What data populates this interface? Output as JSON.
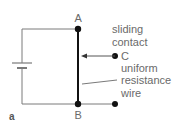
{
  "figure_label": "a",
  "points": {
    "A": "A",
    "B": "B",
    "C": "C"
  },
  "labels": {
    "sliding_contact": [
      "sliding",
      "contact"
    ],
    "uniform_resistance_wire": [
      "uniform",
      "resistance",
      "wire"
    ]
  },
  "colors": {
    "wire": "#7a7a7a",
    "resistance_wire": "#111111",
    "node": "#111111",
    "text": "#6a6a6a"
  }
}
